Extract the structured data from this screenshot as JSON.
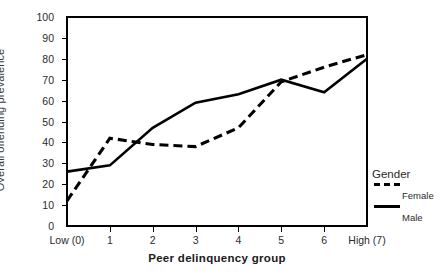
{
  "chart_data": {
    "type": "line",
    "title": "",
    "xlabel": "Peer delinquency group",
    "ylabel": "Overall offending prevalence",
    "x": [
      0,
      1,
      2,
      3,
      4,
      5,
      6,
      7
    ],
    "xtick_labels": [
      "Low (0)",
      "1",
      "2",
      "3",
      "4",
      "5",
      "6",
      "High (7)"
    ],
    "ytick_labels": [
      "0",
      "10",
      "20",
      "30",
      "40",
      "50",
      "60",
      "70",
      "80",
      "90",
      "100"
    ],
    "ylim": [
      0,
      100
    ],
    "xlim": [
      0,
      7
    ],
    "grid": false,
    "legend_position": "right",
    "legend_title": "Gender",
    "series": [
      {
        "name": "Female",
        "style": "dashed",
        "color": "#000000",
        "values": [
          12,
          42,
          39,
          38,
          47,
          69,
          76,
          82
        ]
      },
      {
        "name": "Male",
        "style": "solid",
        "color": "#000000",
        "values": [
          26,
          29,
          47,
          59,
          63,
          70,
          64,
          80
        ]
      }
    ]
  },
  "legend": {
    "title": "Gender",
    "entries": [
      {
        "label": "Female",
        "style": "dashed"
      },
      {
        "label": "Male",
        "style": "solid"
      }
    ]
  },
  "axes": {
    "y_title": "Overall offending prevalence",
    "x_title": "Peer delinquency group"
  }
}
